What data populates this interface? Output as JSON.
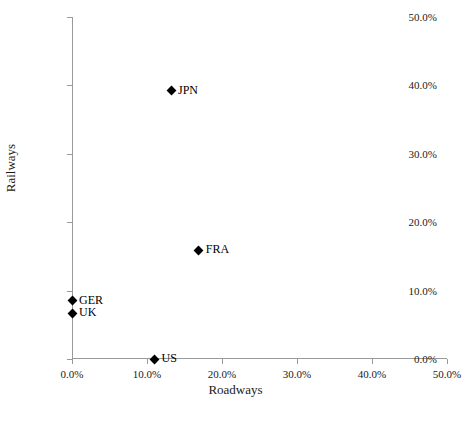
{
  "chart_data": {
    "type": "scatter",
    "title": "",
    "xlabel": "Roadways",
    "ylabel": "Railways",
    "xlim": [
      0,
      50
    ],
    "ylim": [
      0,
      50
    ],
    "xticks": [
      "0.0%",
      "10.0%",
      "20.0%",
      "30.0%",
      "40.0%",
      "50.0%"
    ],
    "xtick_values": [
      0,
      10,
      20,
      30,
      40,
      50
    ],
    "yticks": [
      "0.0%",
      "10.0%",
      "20.0%",
      "30.0%",
      "40.0%",
      "50.0%"
    ],
    "ytick_values": [
      0,
      10,
      20,
      30,
      40,
      50
    ],
    "grid": false,
    "legend": "none",
    "marker": "diamond",
    "marker_color": "#000000",
    "axis_color": "#9a9a9a",
    "points": [
      {
        "label": "JPN",
        "x": 13.2,
        "y": 39.2
      },
      {
        "label": "FRA",
        "x": 16.9,
        "y": 15.9
      },
      {
        "label": "GER",
        "x": 0.0,
        "y": 8.5
      },
      {
        "label": "UK",
        "x": 0.0,
        "y": 6.7
      },
      {
        "label": "US",
        "x": 11.0,
        "y": 0.0
      }
    ]
  },
  "caption": ""
}
